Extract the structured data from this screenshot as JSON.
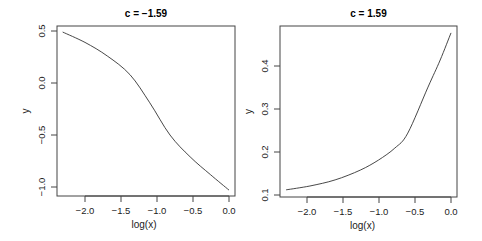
{
  "chart_data": [
    {
      "type": "line",
      "title": "c = −1.59",
      "xlabel": "log(x)",
      "ylabel": "y",
      "xlim": [
        -2.3,
        0.0
      ],
      "ylim": [
        -1.03,
        0.49
      ],
      "xticks": [
        -2.0,
        -1.5,
        -1.0,
        -0.5,
        0.0
      ],
      "xtick_labels": [
        "−2.0",
        "−1.5",
        "−1.0",
        "−0.5",
        "0.0"
      ],
      "yticks": [
        0.5,
        0.0,
        -0.5,
        -1.0
      ],
      "ytick_labels": [
        "0.5",
        "0.0",
        "−0.5",
        "−1.0"
      ],
      "grid": false,
      "series": [
        {
          "name": "y",
          "x": [
            -2.31,
            -2.0,
            -1.69,
            -1.375,
            -1.1,
            -0.82,
            -0.54,
            -0.26,
            0.0
          ],
          "y": [
            0.49,
            0.39,
            0.26,
            0.08,
            -0.19,
            -0.5,
            -0.71,
            -0.88,
            -1.03
          ]
        }
      ]
    },
    {
      "type": "line",
      "title": "c = 1.59",
      "xlabel": "log(x)",
      "ylabel": "y",
      "xlim": [
        -2.3,
        0.0
      ],
      "ylim": [
        0.11,
        0.48
      ],
      "xticks": [
        -2.0,
        -1.5,
        -1.0,
        -0.5,
        0.0
      ],
      "xtick_labels": [
        "−2.0",
        "−1.5",
        "−1.0",
        "−0.5",
        "0.0"
      ],
      "yticks": [
        0.1,
        0.2,
        0.3,
        0.4
      ],
      "ytick_labels": [
        "0.1",
        "0.2",
        "0.3",
        "0.4"
      ],
      "grid": false,
      "series": [
        {
          "name": "y",
          "x": [
            -2.29,
            -1.96,
            -1.61,
            -1.26,
            -1.01,
            -0.78,
            -0.6,
            -0.32,
            -0.15,
            0.0
          ],
          "y": [
            0.112,
            0.121,
            0.135,
            0.158,
            0.181,
            0.209,
            0.244,
            0.351,
            0.414,
            0.477
          ]
        }
      ]
    }
  ],
  "panels": [
    {
      "box": {
        "left": 57,
        "top": 26,
        "right": 235,
        "bottom": 196
      },
      "xmap": {
        "v0": 0.0,
        "p0": 229,
        "scale": 72
      },
      "ymap": {
        "v0": 0.0,
        "p0": 83,
        "scale": 104
      }
    },
    {
      "box": {
        "left": 280,
        "top": 26,
        "right": 457,
        "bottom": 197
      },
      "xmap": {
        "v0": 0.0,
        "p0": 451,
        "scale": 72
      },
      "ymap": {
        "v0": 0.1,
        "p0": 195,
        "scale": 430
      }
    }
  ],
  "colors": {
    "line": "#333333",
    "axis": "#444444",
    "background": "#ffffff"
  }
}
